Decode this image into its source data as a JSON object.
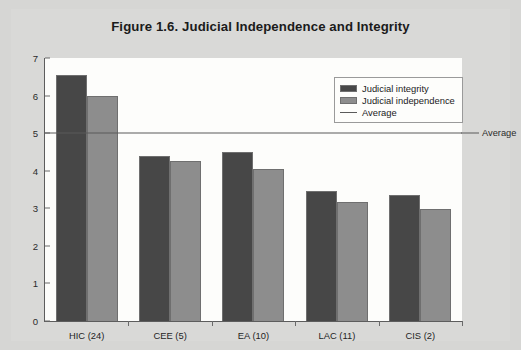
{
  "figure": {
    "title": "Figure 1.6.  Judicial Independence and Integrity",
    "average_label": "Average"
  },
  "colors": {
    "integrity": "#474747",
    "independence": "#8d8d8d",
    "average_line": "#5a5a5a",
    "page_background": "#d6d6d4",
    "plot_background": "#fdfdfb"
  },
  "legend": {
    "items": [
      {
        "label": "Judicial integrity",
        "swatch": "integrity"
      },
      {
        "label": "Judicial independence",
        "swatch": "independence"
      },
      {
        "label": "Average",
        "swatch": "line"
      }
    ]
  },
  "chart_data": {
    "type": "bar",
    "title": "Figure 1.6.  Judicial Independence and Integrity",
    "xlabel": "",
    "ylabel": "",
    "ylim": [
      0,
      7
    ],
    "yticks": [
      0,
      1,
      2,
      3,
      4,
      5,
      6,
      7
    ],
    "ytick_labels": [
      "0",
      "1",
      "2",
      "3",
      "4",
      "5",
      "6",
      "7"
    ],
    "grid": false,
    "legend_position": "upper right",
    "categories": [
      "HIC (24)",
      "CEE (5)",
      "EA (10)",
      "LAC (11)",
      "CIS (2)"
    ],
    "series": [
      {
        "name": "Judicial integrity",
        "values": [
          6.55,
          4.4,
          4.5,
          3.45,
          3.35
        ]
      },
      {
        "name": "Judicial independence",
        "values": [
          6.0,
          4.25,
          4.05,
          3.18,
          2.98
        ]
      }
    ],
    "annotations": [
      {
        "type": "hline",
        "label": "Average",
        "value": 5.0
      }
    ]
  }
}
